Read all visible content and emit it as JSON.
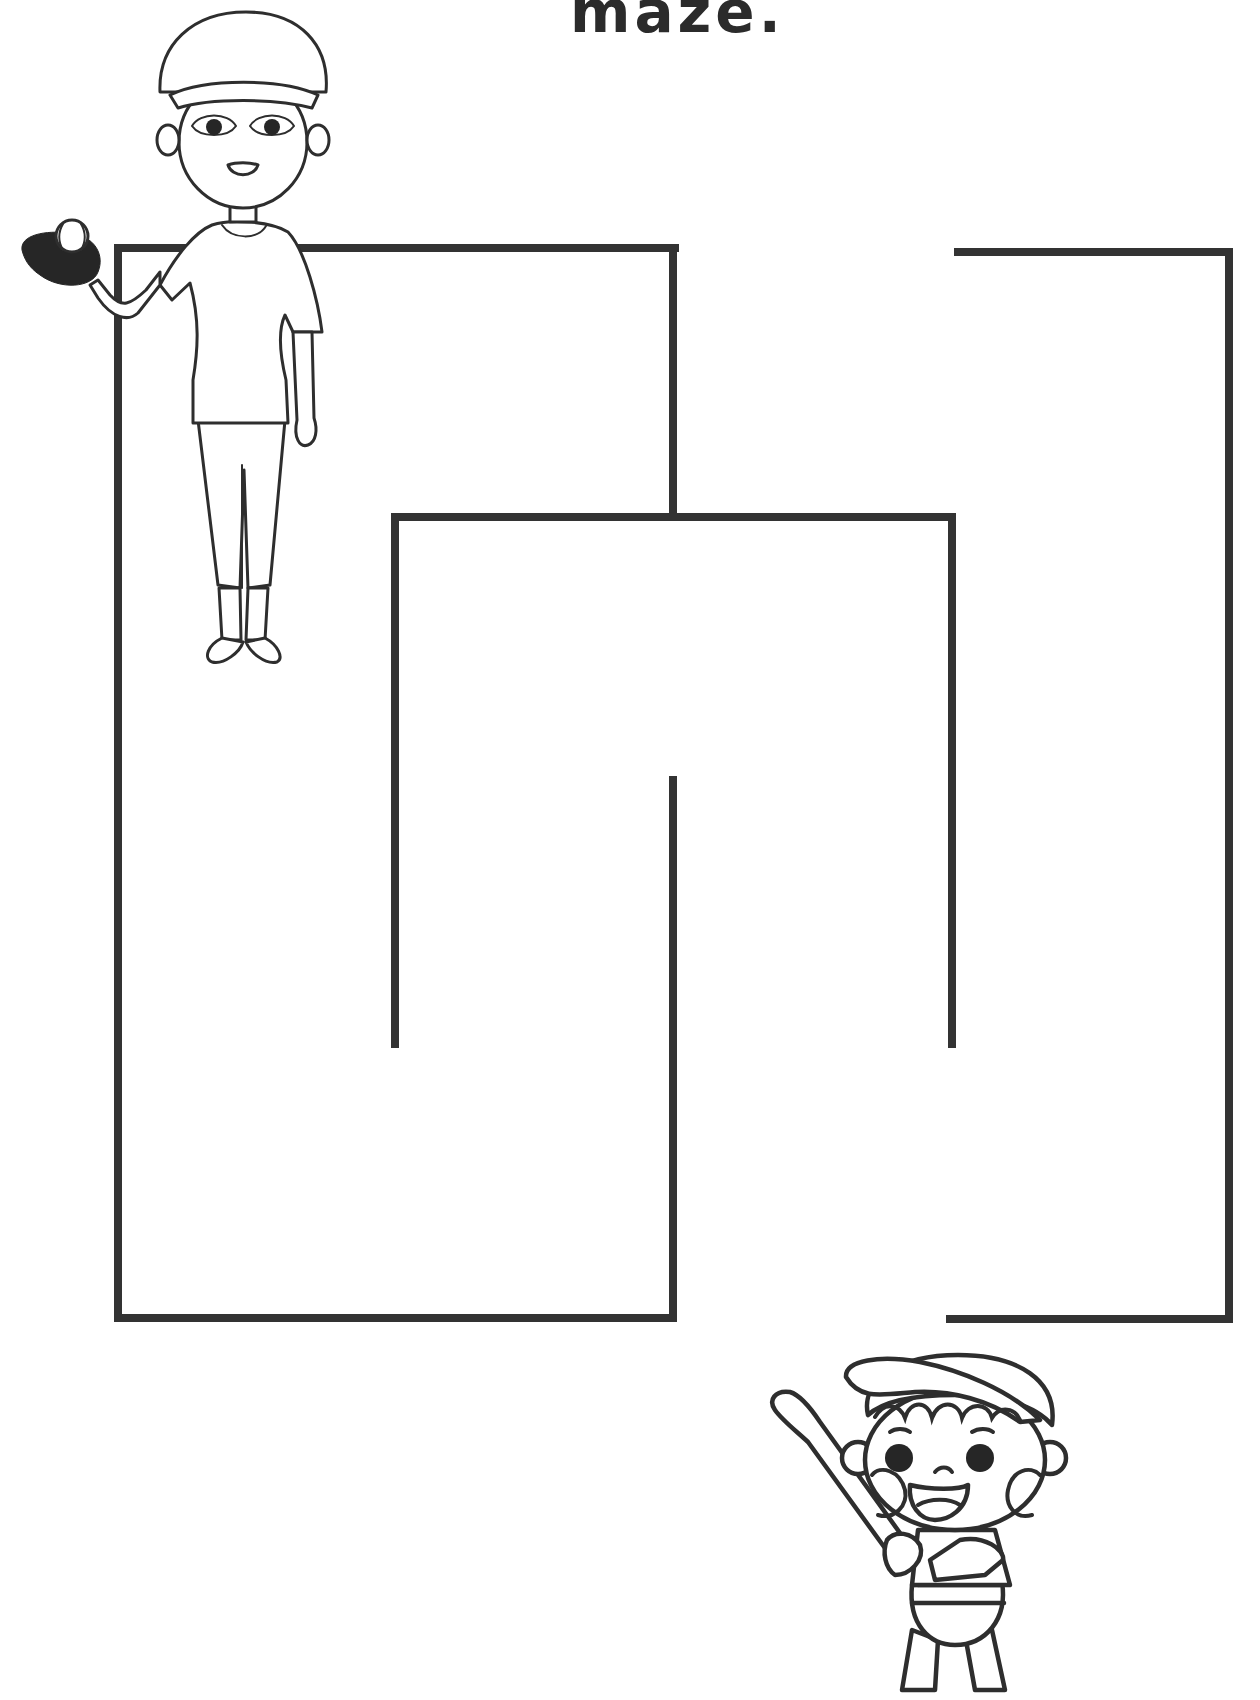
{
  "worksheet": {
    "title_fragment": "maze.",
    "colors": {
      "ink": "#2e2e2e",
      "wall": "#333333",
      "background": "#ffffff"
    }
  },
  "maze": {
    "walls": [
      {
        "name": "top-left-wall",
        "x1": 116,
        "y1": 248,
        "x2": 676,
        "y2": 248
      },
      {
        "name": "left-outer-wall",
        "x1": 118,
        "y1": 248,
        "x2": 118,
        "y2": 1318
      },
      {
        "name": "upper-center-wall",
        "x1": 673,
        "y1": 248,
        "x2": 673,
        "y2": 517
      },
      {
        "name": "middle-box-top-wall",
        "x1": 395,
        "y1": 517,
        "x2": 952,
        "y2": 517
      },
      {
        "name": "left-inner-wall",
        "x1": 395,
        "y1": 517,
        "x2": 395,
        "y2": 1044
      },
      {
        "name": "right-inner-wall",
        "x1": 952,
        "y1": 517,
        "x2": 952,
        "y2": 1044
      },
      {
        "name": "lower-center-wall",
        "x1": 673,
        "y1": 780,
        "x2": 673,
        "y2": 1318
      },
      {
        "name": "bottom-left-wall",
        "x1": 118,
        "y1": 1318,
        "x2": 673,
        "y2": 1318
      },
      {
        "name": "top-right-wall",
        "x1": 956,
        "y1": 252,
        "x2": 1229,
        "y2": 252
      },
      {
        "name": "right-outer-wall",
        "x1": 1229,
        "y1": 252,
        "x2": 1229,
        "y2": 1319
      },
      {
        "name": "bottom-right-wall",
        "x1": 948,
        "y1": 1319,
        "x2": 1229,
        "y2": 1319
      }
    ],
    "start": {
      "label": "woman-with-glove",
      "x": 240,
      "y": 330
    },
    "end": {
      "label": "boy-with-bat",
      "x": 935,
      "y": 1520
    }
  },
  "characters": [
    {
      "id": "woman",
      "description": "woman in baseball cap holding a glove with ball"
    },
    {
      "id": "boy",
      "description": "boy in baseball cap holding a bat"
    }
  ]
}
